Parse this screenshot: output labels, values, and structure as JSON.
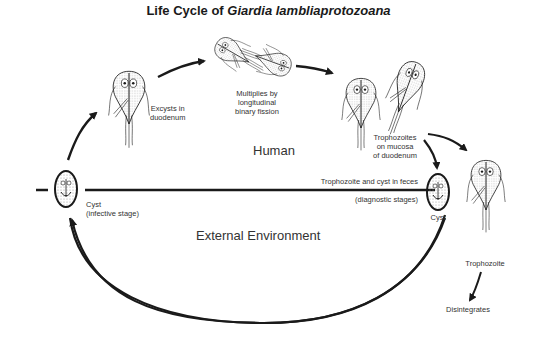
{
  "title": {
    "prefix": "Life Cycle of ",
    "species": "Giardia lambliaprotozoana"
  },
  "regions": {
    "human": "Human",
    "external": "External Environment"
  },
  "stages": {
    "excyst": [
      "Excysts in",
      "duodenum"
    ],
    "multiply": [
      "Multiplies by",
      "longitudinal",
      "binary fission"
    ],
    "mucosa": [
      "Trophozoites",
      "on mucosa",
      "of duodenum"
    ],
    "feces": "Trophozoite and cyst in feces",
    "diagnostic": "(diagnostic stages)",
    "cyst_right": "Cyst",
    "cyst_left": [
      "Cyst",
      "(infective stage)"
    ],
    "trophozoite": "Trophozoite",
    "disintegrates": "Disintegrates"
  },
  "colors": {
    "ink": "#1a1a1a",
    "stipple": "#9a9a9a",
    "background": "#ffffff"
  }
}
